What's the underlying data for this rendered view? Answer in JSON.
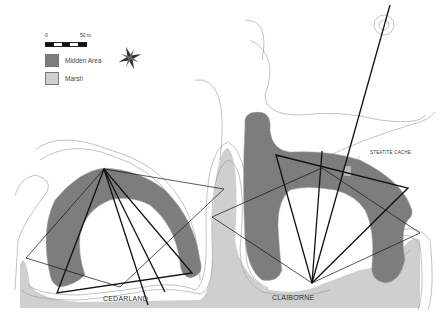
{
  "legend": {
    "scale": {
      "start": "0",
      "end": "50 m"
    },
    "items": [
      {
        "label": "Midden Area",
        "color": "#7d7d7d"
      },
      {
        "label": "Marsh",
        "color": "#cfcfcf"
      }
    ]
  },
  "compass": {
    "icon": "compass-rose-icon"
  },
  "sites": [
    {
      "label": "CEDARLAND"
    },
    {
      "label": "CLAIBORNE"
    }
  ],
  "annotations": [
    {
      "label": "STEATITE CACHE"
    }
  ],
  "colors": {
    "midden": "#7d7d7d",
    "marsh": "#cfcfcf",
    "contour": "#999999",
    "lines": "#111111"
  }
}
